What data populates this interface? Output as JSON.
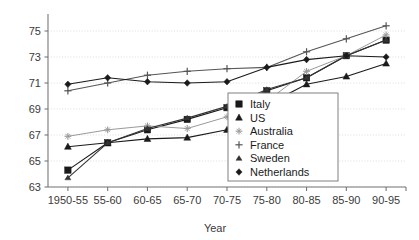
{
  "chart_data": {
    "type": "line",
    "title": "",
    "xlabel": "Year",
    "ylabel": "",
    "categories": [
      "1950-55",
      "55-60",
      "60-65",
      "65-70",
      "70-75",
      "75-80",
      "80-85",
      "85-90",
      "90-95"
    ],
    "ylim": [
      63,
      76
    ],
    "yticks": [
      63,
      65,
      67,
      69,
      71,
      73,
      75
    ],
    "grid": true,
    "legend_position": "center-right-inside",
    "series": [
      {
        "name": "Italy",
        "marker": "filled-square",
        "color": "#1a1a1a",
        "values": [
          64.3,
          66.4,
          67.4,
          68.2,
          69.1,
          70.4,
          71.4,
          73.1,
          74.3
        ]
      },
      {
        "name": "US",
        "marker": "filled-triangle",
        "color": "#1a1a1a",
        "values": [
          66.1,
          66.4,
          66.7,
          66.8,
          67.4,
          69.3,
          70.9,
          71.5,
          72.5
        ]
      },
      {
        "name": "Australia",
        "marker": "light-star",
        "color": "#9a9a9a",
        "values": [
          66.9,
          67.4,
          67.7,
          67.5,
          68.4,
          69.6,
          71.9,
          73.1,
          74.7
        ]
      },
      {
        "name": "France",
        "marker": "plus",
        "color": "#555555",
        "values": [
          70.4,
          71.0,
          71.6,
          71.9,
          72.1,
          72.2,
          73.4,
          74.4,
          75.4
        ]
      },
      {
        "name": "Sweden",
        "marker": "small-triangle",
        "color": "#333333",
        "values": [
          63.7,
          66.4,
          67.5,
          68.3,
          69.2,
          70.5,
          71.4,
          73.1,
          74.3
        ]
      },
      {
        "name": "Netherlands",
        "marker": "filled-diamond",
        "color": "#1a1a1a",
        "values": [
          70.9,
          71.4,
          71.1,
          71.0,
          71.1,
          72.2,
          72.8,
          73.1,
          73.0
        ]
      }
    ]
  },
  "legend": {
    "items": [
      {
        "label": "Italy",
        "marker": "filled-square"
      },
      {
        "label": "US",
        "marker": "filled-triangle"
      },
      {
        "label": "Australia",
        "marker": "light-star"
      },
      {
        "label": "France",
        "marker": "plus"
      },
      {
        "label": "Sweden",
        "marker": "small-triangle"
      },
      {
        "label": "Netherlands",
        "marker": "filled-diamond"
      }
    ]
  }
}
